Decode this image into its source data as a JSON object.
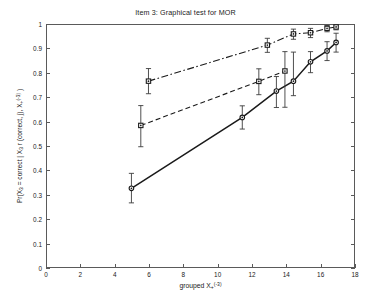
{
  "chart_data": {
    "type": "line",
    "title": "Item 3: Graphical test for MOR",
    "xlabel": "grouped X+^(-3)",
    "ylabel": "Pr(X_3 = correct | X_3 r (correct, j), X+^(-3))",
    "xlim": [
      0,
      18
    ],
    "ylim": [
      0,
      1
    ],
    "xticks": [
      0,
      2,
      4,
      6,
      8,
      10,
      12,
      14,
      16,
      18
    ],
    "yticks": [
      0,
      0.1,
      0.2,
      0.3,
      0.4,
      0.5,
      0.6,
      0.7,
      0.8,
      0.9,
      1
    ],
    "grid": false,
    "legend": "none",
    "series": [
      {
        "name": "observed-solid",
        "linestyle": "solid",
        "marker": "circle",
        "color": "#1a1a1a",
        "points": [
          {
            "x": 4.95,
            "y": 0.325,
            "err_low": 0.06,
            "err_high": 0.062
          },
          {
            "x": 11.45,
            "y": 0.618,
            "err_low": 0.048,
            "err_high": 0.048
          },
          {
            "x": 13.45,
            "y": 0.727,
            "err_low": 0.068,
            "err_high": 0.06
          },
          {
            "x": 14.45,
            "y": 0.768,
            "err_low": 0.06,
            "err_high": 0.12
          },
          {
            "x": 15.45,
            "y": 0.848,
            "err_low": 0.045,
            "err_high": 0.042
          },
          {
            "x": 16.42,
            "y": 0.893,
            "err_low": 0.04,
            "err_high": 0.038
          },
          {
            "x": 16.95,
            "y": 0.928,
            "err_low": 0.04,
            "err_high": 0.038
          }
        ]
      },
      {
        "name": "expected-dashed",
        "linestyle": "dashed",
        "marker": "square",
        "color": "#1a1a1a",
        "points": [
          {
            "x": 5.5,
            "y": 0.585,
            "err_low": 0.088,
            "err_high": 0.082
          },
          {
            "x": 12.42,
            "y": 0.767,
            "err_low": 0.055,
            "err_high": 0.052
          },
          {
            "x": 13.95,
            "y": 0.81,
            "err_low": 0.15,
            "err_high": 0.08
          }
        ]
      },
      {
        "name": "upper-dashdot",
        "linestyle": "dashdot",
        "marker": "square",
        "color": "#1a1a1a",
        "points": [
          {
            "x": 5.95,
            "y": 0.768,
            "err_low": 0.052,
            "err_high": 0.052
          },
          {
            "x": 12.92,
            "y": 0.917,
            "err_low": 0.03,
            "err_high": 0.028
          },
          {
            "x": 14.45,
            "y": 0.963,
            "err_low": 0.022,
            "err_high": 0.02
          },
          {
            "x": 15.45,
            "y": 0.968,
            "err_low": 0.02,
            "err_high": 0.018
          },
          {
            "x": 16.42,
            "y": 0.986,
            "err_low": 0.014,
            "err_high": 0.012
          },
          {
            "x": 16.95,
            "y": 0.992,
            "err_low": 0.012,
            "err_high": 0.008
          }
        ]
      }
    ]
  },
  "axes": {
    "x_tick_labels": [
      "0",
      "2",
      "4",
      "6",
      "8",
      "10",
      "12",
      "14",
      "16",
      "18"
    ],
    "y_tick_labels": [
      "0",
      "0.1",
      "0.2",
      "0.3",
      "0.4",
      "0.5",
      "0.6",
      "0.7",
      "0.8",
      "0.9",
      "1"
    ]
  },
  "labels": {
    "ylabel_prefix": "Pr(X",
    "ylabel_sub1": "3",
    "ylabel_mid": " = correct | X",
    "ylabel_sub2": "3",
    "ylabel_mid2": " r (correct, j), X",
    "ylabel_sub3": "+",
    "ylabel_sup": "(-3)",
    "ylabel_close": " )",
    "xlabel_prefix": "grouped X",
    "xlabel_sub": "+",
    "xlabel_sup": "(-3)"
  },
  "style": {
    "ink": "#1a1a1a",
    "axis": "#5a5a5a",
    "background": "#ffffff"
  }
}
